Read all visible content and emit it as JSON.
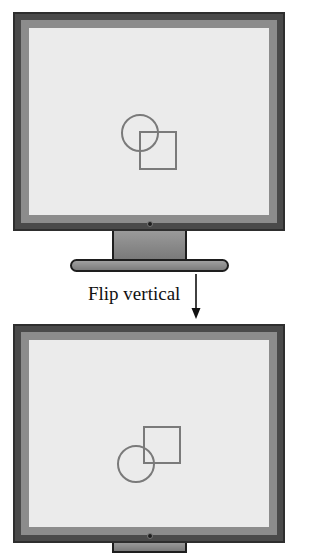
{
  "diagram": {
    "transform_label": "Flip vertical",
    "arrow": "down-arrow",
    "colors": {
      "frame": "#4a4a4a",
      "bezel": "#8c8c8c",
      "screen": "#ebebeb",
      "shape_stroke": "#7a7a7a",
      "text": "#111111"
    },
    "before": {
      "name": "original-monitor",
      "shapes": [
        {
          "type": "circle",
          "cx": 140,
          "cy": 133,
          "r": 18
        },
        {
          "type": "square",
          "x": 140,
          "y": 132,
          "size": 36
        }
      ]
    },
    "after": {
      "name": "flipped-monitor",
      "shapes": [
        {
          "type": "circle",
          "cx": 136,
          "cy": 464,
          "r": 18
        },
        {
          "type": "square",
          "x": 144,
          "y": 427,
          "size": 36
        }
      ]
    }
  }
}
